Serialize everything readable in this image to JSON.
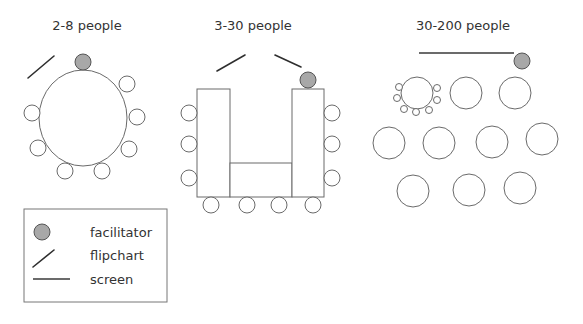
{
  "layouts": [
    {
      "title": "2-8 people",
      "arrangement": "round table",
      "seats": 8,
      "has_facilitator": true,
      "has_flipchart": true,
      "has_screen": false
    },
    {
      "title": "3-30 people",
      "arrangement": "U-shape tables",
      "seats": 10,
      "has_facilitator": true,
      "flipcharts": 2,
      "has_screen": false
    },
    {
      "title": "30-200 people",
      "arrangement": "multiple round tables",
      "tables": 10,
      "seats_shown_at_first_table": 7,
      "has_facilitator": true,
      "has_flipchart": false,
      "has_screen": true
    }
  ],
  "legend": {
    "items": [
      {
        "icon": "facilitator-icon",
        "label": "facilitator"
      },
      {
        "icon": "flipchart-icon",
        "label": "flipchart"
      },
      {
        "icon": "screen-icon",
        "label": "screen"
      }
    ]
  },
  "colors": {
    "facilitator_fill": "#a8a8a8",
    "outline": "#6a6a6a",
    "line": "#2e2e2e",
    "background": "#ffffff"
  }
}
